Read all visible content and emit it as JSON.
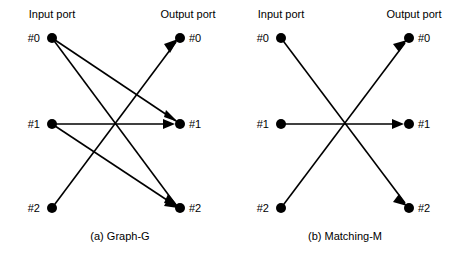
{
  "figure": {
    "width": 457,
    "height": 257,
    "background_color": "#ffffff",
    "ink_color": "#000000"
  },
  "panels": [
    {
      "id": "panel-a",
      "caption": "(a) Graph-G",
      "caption_x": 120,
      "caption_y": 236,
      "input_header": {
        "text": "Input port",
        "x": 52,
        "y": 18
      },
      "output_header": {
        "text": "Output port",
        "x": 188,
        "y": 18
      },
      "input_nodes": [
        {
          "id": "a-in-0",
          "label": "#0",
          "cx": 52,
          "cy": 38,
          "label_x": 32,
          "label_y": 42
        },
        {
          "id": "a-in-1",
          "label": "#1",
          "cx": 52,
          "cy": 124,
          "label_x": 32,
          "label_y": 128
        },
        {
          "id": "a-in-2",
          "label": "#2",
          "cx": 52,
          "cy": 208,
          "label_x": 32,
          "label_y": 212
        }
      ],
      "output_nodes": [
        {
          "id": "a-out-0",
          "label": "#0",
          "cx": 180,
          "cy": 38,
          "label_x": 189,
          "label_y": 42
        },
        {
          "id": "a-out-1",
          "label": "#1",
          "cx": 180,
          "cy": 124,
          "label_x": 189,
          "label_y": 128
        },
        {
          "id": "a-out-2",
          "label": "#2",
          "cx": 180,
          "cy": 208,
          "label_x": 189,
          "label_y": 212
        }
      ],
      "edges": [
        {
          "id": "a-e0",
          "from": "#0",
          "to": "#1",
          "x1": 52,
          "y1": 38,
          "x2": 180,
          "y2": 124,
          "arrow": true
        },
        {
          "id": "a-e1",
          "from": "#0",
          "to": "#2",
          "x1": 52,
          "y1": 38,
          "x2": 180,
          "y2": 208,
          "arrow": true
        },
        {
          "id": "a-e2",
          "from": "#1",
          "to": "#1",
          "x1": 52,
          "y1": 124,
          "x2": 180,
          "y2": 124,
          "arrow": true
        },
        {
          "id": "a-e3",
          "from": "#1",
          "to": "#2",
          "x1": 52,
          "y1": 124,
          "x2": 180,
          "y2": 208,
          "arrow": true
        },
        {
          "id": "a-e4",
          "from": "#2",
          "to": "#0",
          "x1": 52,
          "y1": 208,
          "x2": 180,
          "y2": 38,
          "arrow": true
        }
      ]
    },
    {
      "id": "panel-b",
      "caption": "(b) Matching-M",
      "caption_x": 345,
      "caption_y": 236,
      "input_header": {
        "text": "Input port",
        "x": 280,
        "y": 18
      },
      "output_header": {
        "text": "Output port",
        "x": 415,
        "y": 18
      },
      "input_nodes": [
        {
          "id": "b-in-0",
          "label": "#0",
          "cx": 281,
          "cy": 38,
          "label_x": 261,
          "label_y": 42
        },
        {
          "id": "b-in-1",
          "label": "#1",
          "cx": 281,
          "cy": 124,
          "label_x": 261,
          "label_y": 128
        },
        {
          "id": "b-in-2",
          "label": "#2",
          "cx": 281,
          "cy": 208,
          "label_x": 261,
          "label_y": 212
        }
      ],
      "output_nodes": [
        {
          "id": "b-out-0",
          "label": "#0",
          "cx": 409,
          "cy": 38,
          "label_x": 418,
          "label_y": 42
        },
        {
          "id": "b-out-1",
          "label": "#1",
          "cx": 409,
          "cy": 124,
          "label_x": 418,
          "label_y": 128
        },
        {
          "id": "b-out-2",
          "label": "#2",
          "cx": 409,
          "cy": 208,
          "label_x": 418,
          "label_y": 212
        }
      ],
      "edges": [
        {
          "id": "b-e0",
          "from": "#0",
          "to": "#2",
          "x1": 281,
          "y1": 38,
          "x2": 409,
          "y2": 208,
          "arrow": true
        },
        {
          "id": "b-e1",
          "from": "#1",
          "to": "#1",
          "x1": 281,
          "y1": 124,
          "x2": 409,
          "y2": 124,
          "arrow": true
        },
        {
          "id": "b-e2",
          "from": "#2",
          "to": "#0",
          "x1": 281,
          "y1": 208,
          "x2": 409,
          "y2": 38,
          "arrow": true
        }
      ]
    }
  ]
}
